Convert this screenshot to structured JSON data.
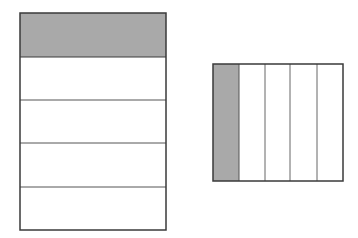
{
  "diagram": {
    "colors": {
      "shade": "#a9a9a9",
      "stroke": "#3a3a3a",
      "background": "#ffffff"
    },
    "shapes": [
      {
        "name": "horizontal-fraction-model",
        "orientation": "rows",
        "parts": 5,
        "shaded_parts": [
          0
        ],
        "fraction_shaded": "1/5"
      },
      {
        "name": "vertical-fraction-model",
        "orientation": "columns",
        "parts": 5,
        "shaded_parts": [
          0
        ],
        "fraction_shaded": "1/5"
      }
    ]
  }
}
